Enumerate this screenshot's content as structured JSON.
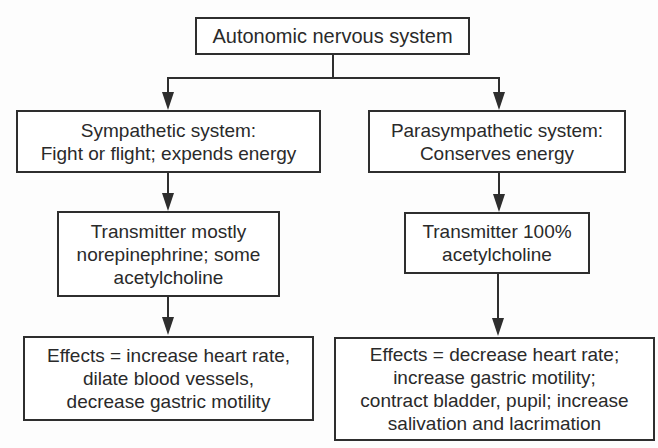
{
  "diagram": {
    "type": "flowchart",
    "root": {
      "lines": [
        "Autonomic nervous system"
      ]
    },
    "sympathetic": {
      "title": {
        "lines": [
          "Sympathetic system:",
          "Fight or flight; expends energy"
        ]
      },
      "transmitter": {
        "lines": [
          "Transmitter mostly",
          "norepinephrine; some",
          "acetylcholine"
        ]
      },
      "effects": {
        "lines": [
          "Effects = increase heart rate,",
          "dilate blood vessels,",
          "decrease gastric motility"
        ]
      }
    },
    "parasympathetic": {
      "title": {
        "lines": [
          "Parasympathetic system:",
          "Conserves energy"
        ]
      },
      "transmitter": {
        "lines": [
          "Transmitter 100%",
          "acetylcholine"
        ]
      },
      "effects": {
        "lines": [
          "Effects = decrease heart rate;",
          "increase gastric motility;",
          "contract bladder, pupil; increase",
          "salivation and lacrimation"
        ]
      }
    },
    "edges": [
      [
        "Autonomic nervous system",
        "Sympathetic system"
      ],
      [
        "Autonomic nervous system",
        "Parasympathetic system"
      ],
      [
        "Sympathetic system",
        "Sympathetic transmitter"
      ],
      [
        "Sympathetic transmitter",
        "Sympathetic effects"
      ],
      [
        "Parasympathetic system",
        "Parasympathetic transmitter"
      ],
      [
        "Parasympathetic transmitter",
        "Parasympathetic effects"
      ]
    ]
  }
}
